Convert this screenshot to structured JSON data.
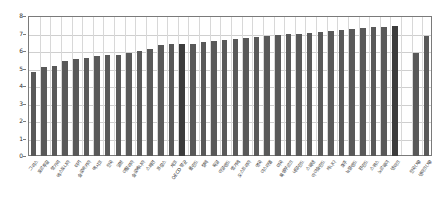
{
  "chart_data": {
    "type": "bar",
    "title": "",
    "subtitle": "",
    "xlabel": "",
    "ylabel": "",
    "ylim": [
      0,
      8
    ],
    "y_ticks": [
      0,
      1,
      2,
      3,
      4,
      5,
      6,
      7,
      8
    ],
    "grid": true,
    "legend": "none",
    "bar_color": "#595959",
    "highlight_color": "#3c3c3c",
    "axis_color": "#7a7a7a",
    "grid_color": "#cfcfcf",
    "note": "Bars sorted ascending; a gap separates the last two bars from the main group.",
    "categories": [
      "그리스",
      "포르투갈",
      "헝가리",
      "에스토니아",
      "터키",
      "슬로바키아",
      "멕시코",
      "한국",
      "일본",
      "이탈리아",
      "슬로베니아",
      "스페인",
      "프랑스",
      "체코",
      "OECD 평균",
      "폴란드",
      "칠레",
      "독일",
      "아일랜드",
      "벨기에",
      "오스트리아",
      "영국",
      "이스라엘",
      "미국",
      "룩셈부르크",
      "네덜란드",
      "스웨덴",
      "아이슬란드",
      "캐나다",
      "호주",
      "뉴질랜드",
      "핀란드",
      "스위스",
      "노르웨이",
      "덴마크",
      "",
      "한국(재)",
      "덴마크(재)"
    ],
    "values": [
      4.8,
      5.1,
      5.15,
      5.45,
      5.55,
      5.6,
      5.7,
      5.75,
      5.8,
      5.9,
      6.0,
      6.1,
      6.35,
      6.4,
      6.4,
      6.4,
      6.5,
      6.6,
      6.65,
      6.7,
      6.75,
      6.8,
      6.85,
      6.9,
      6.95,
      7.0,
      7.05,
      7.1,
      7.15,
      7.2,
      7.25,
      7.3,
      7.35,
      7.4,
      7.45,
      null,
      5.9,
      6.85
    ],
    "highlight_indices": [
      14,
      34
    ],
    "gap_after_index": 34
  },
  "yaxis": {
    "ticks": [
      "8",
      "7",
      "6",
      "5",
      "4",
      "3",
      "2",
      "1",
      "0"
    ]
  }
}
